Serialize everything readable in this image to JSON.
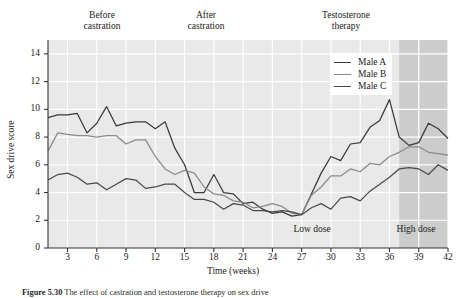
{
  "phases": {
    "before": "Before\ncastration",
    "before_line1": "Before",
    "before_line2": "castration",
    "after_line1": "After",
    "after_line2": "castration",
    "testo_line1": "Testosterone",
    "testo_line2": "therapy"
  },
  "dose": {
    "low": "Low dose",
    "high": "High dose"
  },
  "legend": {
    "items": [
      {
        "label": "Male A",
        "color": "#3a3a3a"
      },
      {
        "label": "Male B",
        "color": "#8a8a8a"
      },
      {
        "label": "Male C",
        "color": "#4a4a4a"
      }
    ]
  },
  "caption": {
    "figure_no": "Figure 5.30",
    "text": "The effect of castration and testosterone therapy on sex drive"
  },
  "colors": {
    "plot_background": "#e9e9e9",
    "gridline": "#ffffff",
    "shaded_band": "#cccccc",
    "axis": "#333333",
    "series_a": "#3a3a3a",
    "series_b": "#8a8a8a",
    "series_c": "#4a4a4a"
  },
  "chart_data": {
    "type": "line",
    "title": "",
    "xlabel": "Time (weeks)",
    "ylabel": "Sex drive score",
    "xlim": [
      1,
      42
    ],
    "ylim": [
      0,
      15
    ],
    "xticks": [
      3,
      6,
      9,
      12,
      15,
      18,
      21,
      24,
      27,
      30,
      33,
      36,
      39,
      42
    ],
    "yticks": [
      0,
      2,
      4,
      6,
      8,
      10,
      12,
      14
    ],
    "grid": true,
    "legend_position": "top-right",
    "x": [
      1,
      2,
      3,
      4,
      5,
      6,
      7,
      8,
      9,
      10,
      11,
      12,
      13,
      14,
      15,
      16,
      17,
      18,
      19,
      20,
      21,
      22,
      23,
      24,
      25,
      26,
      27,
      28,
      29,
      30,
      31,
      32,
      33,
      34,
      35,
      36,
      37,
      38,
      39,
      40,
      41,
      42
    ],
    "series": [
      {
        "name": "Male A",
        "values": [
          9.4,
          9.6,
          9.6,
          9.7,
          8.3,
          9.0,
          10.2,
          8.8,
          9.0,
          9.1,
          9.1,
          8.6,
          9.1,
          7.2,
          6.0,
          4.0,
          4.0,
          5.3,
          4.0,
          3.9,
          3.2,
          3.3,
          2.8,
          2.5,
          2.6,
          2.3,
          2.4,
          3.9,
          5.4,
          6.6,
          6.3,
          7.5,
          7.6,
          8.7,
          9.2,
          10.7,
          8.0,
          7.4,
          7.6,
          9.0,
          8.6,
          7.9
        ]
      },
      {
        "name": "Male B",
        "values": [
          7.0,
          8.3,
          8.2,
          8.1,
          8.1,
          8.0,
          8.1,
          8.1,
          7.5,
          7.8,
          7.8,
          6.6,
          5.7,
          5.3,
          5.6,
          5.4,
          4.4,
          3.9,
          3.8,
          3.4,
          3.3,
          2.9,
          3.0,
          3.2,
          3.0,
          2.5,
          2.4,
          3.8,
          4.4,
          5.2,
          5.2,
          5.7,
          5.5,
          6.1,
          6.0,
          6.6,
          6.9,
          7.3,
          7.3,
          6.9,
          6.8,
          6.7
        ]
      },
      {
        "name": "Male C",
        "values": [
          4.9,
          5.3,
          5.4,
          5.1,
          4.6,
          4.7,
          4.2,
          4.6,
          5.0,
          4.9,
          4.3,
          4.4,
          4.6,
          4.6,
          4.0,
          3.5,
          3.5,
          3.3,
          2.8,
          3.2,
          3.1,
          2.7,
          2.7,
          2.6,
          2.7,
          2.6,
          2.4,
          2.9,
          3.2,
          2.8,
          3.6,
          3.7,
          3.4,
          4.1,
          4.6,
          5.1,
          5.7,
          5.8,
          5.7,
          5.3,
          6.0,
          5.6
        ]
      }
    ],
    "annotations": [
      {
        "text": "Before castration",
        "x_range": [
          1,
          12
        ]
      },
      {
        "text": "After castration",
        "x_range": [
          12,
          27
        ]
      },
      {
        "text": "Testosterone therapy",
        "x_range": [
          27,
          42
        ]
      },
      {
        "text": "Low dose",
        "x_range": [
          27,
          37
        ]
      },
      {
        "text": "High dose",
        "x_range": [
          37,
          42
        ]
      }
    ]
  }
}
